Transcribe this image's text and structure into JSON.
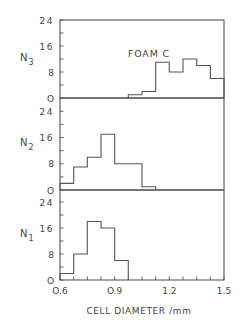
{
  "chart_data": {
    "type": "bar",
    "subtype": "stacked-panel-histogram",
    "title": "",
    "annotation": "FOAM C",
    "xlabel": "CELL DIAMETER /mm",
    "xlim": [
      0.6,
      1.5
    ],
    "x_ticks": [
      "0.6",
      "0.9",
      "1.2",
      "1.5"
    ],
    "bin_width": 0.075,
    "bin_edges": [
      0.6,
      0.675,
      0.75,
      0.825,
      0.9,
      0.975,
      1.05,
      1.125,
      1.2,
      1.275,
      1.35,
      1.425,
      1.5
    ],
    "panels": [
      {
        "name": "N3",
        "ylabel": "N",
        "ylabel_sub": "3",
        "ylim": [
          0,
          24
        ],
        "y_ticks": [
          "24",
          "16",
          "8",
          "0"
        ],
        "bins": [
          {
            "x0": 0.975,
            "x1": 1.05,
            "value": 1
          },
          {
            "x0": 1.05,
            "x1": 1.125,
            "value": 2
          },
          {
            "x0": 1.125,
            "x1": 1.2,
            "value": 11
          },
          {
            "x0": 1.2,
            "x1": 1.275,
            "value": 8
          },
          {
            "x0": 1.275,
            "x1": 1.35,
            "value": 12
          },
          {
            "x0": 1.35,
            "x1": 1.425,
            "value": 10
          },
          {
            "x0": 1.425,
            "x1": 1.5,
            "value": 6
          }
        ]
      },
      {
        "name": "N2",
        "ylabel": "N",
        "ylabel_sub": "2",
        "ylim": [
          0,
          24
        ],
        "y_ticks": [
          "24",
          "16",
          "8",
          "0"
        ],
        "bins": [
          {
            "x0": 0.6,
            "x1": 0.675,
            "value": 2
          },
          {
            "x0": 0.675,
            "x1": 0.75,
            "value": 7
          },
          {
            "x0": 0.75,
            "x1": 0.825,
            "value": 10
          },
          {
            "x0": 0.825,
            "x1": 0.9,
            "value": 17
          },
          {
            "x0": 0.9,
            "x1": 1.05,
            "value": 8
          },
          {
            "x0": 1.05,
            "x1": 1.125,
            "value": 1
          }
        ]
      },
      {
        "name": "N1",
        "ylabel": "N",
        "ylabel_sub": "1",
        "ylim": [
          0,
          24
        ],
        "y_ticks": [
          "24",
          "16",
          "8",
          "0"
        ],
        "bins": [
          {
            "x0": 0.6,
            "x1": 0.675,
            "value": 2
          },
          {
            "x0": 0.675,
            "x1": 0.75,
            "value": 8
          },
          {
            "x0": 0.75,
            "x1": 0.825,
            "value": 18
          },
          {
            "x0": 0.825,
            "x1": 0.9,
            "value": 16
          },
          {
            "x0": 0.9,
            "x1": 0.975,
            "value": 6
          }
        ]
      }
    ],
    "grid": false,
    "legend": null
  },
  "labels": {
    "annotation": "FOAM C",
    "xlabel": "CELL DIAMETER /mm"
  },
  "colors": {
    "line": "#555555",
    "text": "#444444",
    "background": "#ffffff"
  }
}
